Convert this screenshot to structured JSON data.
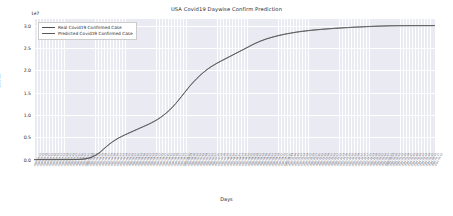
{
  "chart_data": {
    "type": "line",
    "title": "USA Covid19 Daywise Confirm Prediction",
    "xlabel": "Days",
    "ylabel": "Cases",
    "y_offset_text": "1e7",
    "y_offset_multiplier": 10000000,
    "ylim": [
      -0.12,
      3.15
    ],
    "yticks": [
      "0.0",
      "0.5",
      "1.0",
      "1.5",
      "2.0",
      "2.5",
      "3.0"
    ],
    "ytick_values": [
      0.0,
      0.5,
      1.0,
      1.5,
      2.0,
      2.5,
      3.0
    ],
    "grid": true,
    "legend_position": "upper left",
    "xtick_rotation": -62,
    "xtick_labels": [
      "2020-01-22",
      "2020-01-25",
      "2020-01-28",
      "2020-01-31",
      "2020-02-03",
      "2020-02-06",
      "2020-02-09",
      "2020-02-12",
      "2020-02-15",
      "2020-02-18",
      "2020-02-21",
      "2020-02-24",
      "2020-02-27",
      "2020-03-01",
      "2020-03-04",
      "2020-03-07",
      "2020-03-10",
      "2020-03-13",
      "2020-03-16",
      "2020-03-19",
      "2020-03-22",
      "2020-03-25",
      "2020-03-28",
      "2020-03-31",
      "2020-04-03",
      "2020-04-06",
      "2020-04-09",
      "2020-04-12",
      "2020-04-15",
      "2020-04-18",
      "2020-04-21",
      "2020-04-24",
      "2020-04-27",
      "2020-04-30",
      "2020-05-03",
      "2020-05-06",
      "2020-05-09",
      "2020-05-12",
      "2020-05-15",
      "2020-05-18",
      "2020-05-21",
      "2020-05-24",
      "2020-05-27",
      "2020-05-30",
      "2020-06-02",
      "2020-06-05",
      "2020-06-08",
      "2020-06-11",
      "2020-06-14",
      "2020-06-17",
      "2020-06-20",
      "2020-06-23",
      "2020-06-26",
      "2020-06-29",
      "2020-07-02",
      "2020-07-05",
      "2020-07-08",
      "2020-07-11",
      "2020-07-14",
      "2020-07-17",
      "2020-07-20",
      "2020-07-23",
      "2020-07-26",
      "2020-07-29",
      "2020-08-01",
      "2020-08-04",
      "2020-08-07",
      "2020-08-10",
      "2020-08-13",
      "2020-08-16",
      "2020-08-19",
      "2020-08-22",
      "2020-08-25",
      "2020-08-28",
      "2020-08-31",
      "2020-09-03",
      "2020-09-06",
      "2020-09-09",
      "2020-09-12",
      "2020-09-15",
      "2020-09-18",
      "2020-09-21",
      "2020-09-24",
      "2020-09-27",
      "2020-09-30",
      "2020-10-03",
      "2020-10-06",
      "2020-10-09",
      "2020-10-12",
      "2020-10-15",
      "2020-10-18",
      "2020-10-21",
      "2020-10-24",
      "2020-10-27",
      "2020-10-30",
      "2020-11-02",
      "2020-11-05",
      "2020-11-08",
      "2020-11-11",
      "2020-11-14",
      "2020-11-17",
      "2020-11-20",
      "2020-11-23",
      "2020-11-26",
      "2020-11-29",
      "2020-12-02",
      "2020-12-05",
      "2020-12-08",
      "2020-12-11",
      "2020-12-14",
      "2020-12-17",
      "2020-12-20",
      "2020-12-23",
      "2020-12-26",
      "2020-12-29",
      "2021-01-01",
      "2021-01-04",
      "2021-01-07",
      "2021-01-10",
      "2021-01-13",
      "2021-01-16",
      "2021-01-19",
      "2021-01-22",
      "2021-01-25",
      "2021-01-28",
      "2021-01-31",
      "2021-02-03",
      "2021-02-06",
      "2021-02-09",
      "2021-02-12",
      "2021-02-15",
      "2021-02-18",
      "2021-02-21",
      "2021-02-24",
      "2021-02-27",
      "2021-03-02"
    ],
    "series": [
      {
        "name": "Real Covid19 Confirmed Case",
        "color": "#4c4c4c",
        "values": [
          0.0002,
          0.0003,
          0.0004,
          0.0005,
          0.0006,
          0.0007,
          0.0008,
          0.0009,
          0.001,
          0.0011,
          0.0012,
          0.0013,
          0.0015,
          0.0018,
          0.0025,
          0.0045,
          0.0085,
          0.016,
          0.03,
          0.052,
          0.082,
          0.12,
          0.17,
          0.23,
          0.29,
          0.345,
          0.395,
          0.44,
          0.48,
          0.515,
          0.548,
          0.58,
          0.61,
          0.64,
          0.67,
          0.7,
          0.73,
          0.76,
          0.79,
          0.825,
          0.86,
          0.9,
          0.945,
          0.995,
          1.05,
          1.11,
          1.18,
          1.255,
          1.335,
          1.42,
          1.505,
          1.59,
          1.67,
          1.745,
          1.815,
          1.88,
          1.94,
          1.995,
          2.045,
          2.09,
          2.13,
          2.17,
          2.205,
          2.24,
          2.275,
          2.31,
          2.345,
          2.38,
          2.415,
          2.45,
          2.485,
          2.52,
          2.555,
          2.59,
          2.62,
          2.65,
          2.675,
          2.7,
          2.72,
          2.74,
          2.758,
          2.775,
          2.79,
          2.805,
          2.818,
          2.83,
          2.842,
          2.853,
          2.863,
          2.872,
          2.88,
          2.888,
          2.895,
          2.902,
          2.908,
          2.914,
          2.92,
          2.925,
          2.93,
          2.935,
          2.94,
          2.944,
          2.948,
          2.952,
          2.956,
          2.96,
          2.964,
          2.967,
          2.97,
          2.973,
          2.976,
          2.979,
          2.982,
          2.985,
          2.987,
          2.989,
          2.991,
          2.993,
          2.995,
          2.996,
          2.997,
          2.998,
          2.9985,
          2.999,
          2.9993,
          2.9995,
          2.9997,
          2.9998,
          2.9999,
          3.0,
          3.0,
          3.0,
          3.0,
          3.0
        ]
      },
      {
        "name": "Predicted Covid19 Confirmed Case",
        "color": "#5a5a5a",
        "values": [
          0.0002,
          0.0003,
          0.0004,
          0.0005,
          0.0006,
          0.0007,
          0.0008,
          0.0009,
          0.001,
          0.0011,
          0.0012,
          0.0014,
          0.0016,
          0.002,
          0.0028,
          0.005,
          0.009,
          0.0168,
          0.0312,
          0.0535,
          0.084,
          0.1225,
          0.173,
          0.2335,
          0.2935,
          0.349,
          0.399,
          0.444,
          0.484,
          0.519,
          0.552,
          0.584,
          0.614,
          0.644,
          0.674,
          0.704,
          0.734,
          0.764,
          0.794,
          0.829,
          0.864,
          0.904,
          0.949,
          0.999,
          1.054,
          1.114,
          1.184,
          1.259,
          1.339,
          1.424,
          1.509,
          1.594,
          1.674,
          1.749,
          1.819,
          1.884,
          1.944,
          1.999,
          2.049,
          2.094,
          2.134,
          2.174,
          2.209,
          2.244,
          2.279,
          2.314,
          2.349,
          2.384,
          2.419,
          2.454,
          2.489,
          2.524,
          2.559,
          2.594,
          2.624,
          2.654,
          2.679,
          2.704,
          2.724,
          2.744,
          2.762,
          2.779,
          2.794,
          2.809,
          2.822,
          2.834,
          2.846,
          2.857,
          2.867,
          2.876,
          2.884,
          2.892,
          2.899,
          2.906,
          2.912,
          2.918,
          2.924,
          2.929,
          2.934,
          2.939,
          2.944,
          2.948,
          2.952,
          2.956,
          2.96,
          2.964,
          2.968,
          2.971,
          2.974,
          2.977,
          2.98,
          2.983,
          2.986,
          2.989,
          2.991,
          2.993,
          2.995,
          2.997,
          2.9985,
          2.9995,
          3.0,
          3.0005,
          3.0008,
          3.001,
          3.0012,
          3.0013,
          3.0014,
          3.0015,
          3.0016,
          3.0017,
          3.0017,
          3.0018,
          3.0018,
          3.0018
        ]
      }
    ]
  },
  "legend": {
    "entries": [
      {
        "label": "Real Covid19 Confirmed Case",
        "color": "#4c4c4c"
      },
      {
        "label": "Predicted Covid19 Confirmed Case",
        "color": "#5a5a5a"
      }
    ]
  },
  "colors": {
    "plot_background": "#eaeaf2",
    "figure_background": "#ffffff",
    "gridline": "#ffffff",
    "text": "#2b2b2b"
  }
}
